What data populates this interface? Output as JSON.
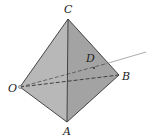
{
  "diagram": {
    "type": "tetrahedron",
    "labels": {
      "C": "C",
      "O": "O",
      "B": "B",
      "A": "A",
      "D": "D"
    },
    "colors": {
      "left_face": "#b8b8b8",
      "right_face": "#a3a3a3",
      "edge": "#333333",
      "ray": "#888888",
      "background": "#ffffff"
    }
  }
}
